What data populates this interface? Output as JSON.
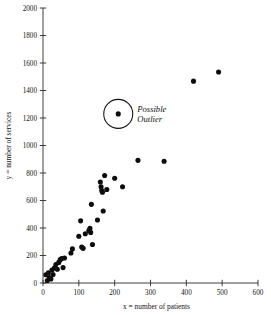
{
  "chart_data": {
    "type": "scatter",
    "title": "",
    "xlabel": "x = number of patients",
    "ylabel": "y = number of services",
    "xlim": [
      0,
      600
    ],
    "ylim": [
      0,
      2000
    ],
    "xticks": [
      0,
      100,
      200,
      300,
      400,
      500,
      600
    ],
    "yticks": [
      0,
      200,
      400,
      600,
      800,
      1000,
      1200,
      1400,
      1600,
      1800,
      2000
    ],
    "grid": false,
    "legend": false,
    "marker": "filled-circle",
    "marker_color": "#0d0d0d",
    "points": [
      [
        8,
        60
      ],
      [
        12,
        18
      ],
      [
        15,
        75
      ],
      [
        18,
        40
      ],
      [
        22,
        30
      ],
      [
        25,
        95
      ],
      [
        28,
        62
      ],
      [
        32,
        110
      ],
      [
        36,
        135
      ],
      [
        40,
        100
      ],
      [
        44,
        150
      ],
      [
        48,
        170
      ],
      [
        52,
        178
      ],
      [
        56,
        112
      ],
      [
        60,
        182
      ],
      [
        78,
        218
      ],
      [
        82,
        248
      ],
      [
        100,
        340
      ],
      [
        105,
        452
      ],
      [
        108,
        262
      ],
      [
        112,
        252
      ],
      [
        118,
        358
      ],
      [
        128,
        382
      ],
      [
        131,
        398
      ],
      [
        133,
        368
      ],
      [
        135,
        572
      ],
      [
        138,
        280
      ],
      [
        152,
        458
      ],
      [
        160,
        735
      ],
      [
        162,
        700
      ],
      [
        164,
        672
      ],
      [
        166,
        660
      ],
      [
        168,
        524
      ],
      [
        172,
        782
      ],
      [
        178,
        680
      ],
      [
        200,
        762
      ],
      [
        210,
        1230
      ],
      [
        222,
        700
      ],
      [
        265,
        892
      ],
      [
        338,
        886
      ],
      [
        420,
        1468
      ],
      [
        490,
        1535
      ]
    ],
    "annotations": [
      {
        "id": "possible-outlier",
        "text_line1": "Possible",
        "text_line2": "Outlier",
        "target_point": [
          210,
          1230
        ],
        "shape": "circle",
        "radius_px": 14.5
      }
    ]
  }
}
